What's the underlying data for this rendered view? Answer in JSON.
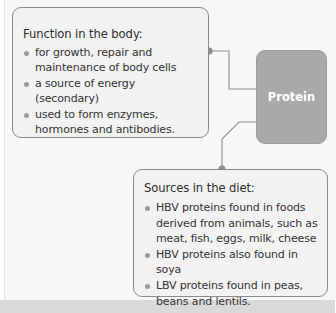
{
  "diagram": {
    "central_node": {
      "label": "Protein",
      "color": "#a9a9a9"
    },
    "function_box": {
      "title": "Function in the body:",
      "items": [
        "for growth, repair and maintenance of body cells",
        "a source of energy (secondary)",
        "used to form enzymes, hormones and antibodies."
      ]
    },
    "sources_box": {
      "title": "Sources in the diet:",
      "items": [
        "HBV proteins found in foods derived from animals, such as meat, fish, eggs, milk, cheese",
        "HBV proteins also found in soya",
        "LBV proteins found in peas, beans and lentils."
      ]
    },
    "colors": {
      "box_background": "#f2f2f2",
      "box_border": "#8a8a8a",
      "connector": "#8a8a8a",
      "connector_dot": "#8c8c8c",
      "central_text": "#ffffff"
    }
  }
}
